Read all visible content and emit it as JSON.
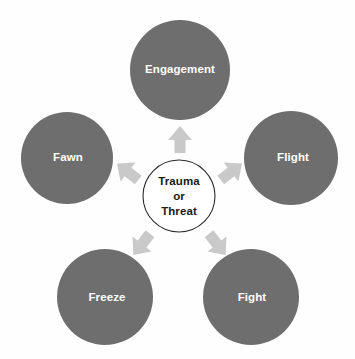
{
  "diagram": {
    "background_color": "#fefefe",
    "center": {
      "name": "trauma-or-threat",
      "lines": [
        "Trauma",
        "or",
        "Threat"
      ],
      "fill_color": "#ffffff",
      "stroke_color": "#2b2b2b",
      "text_color": "#1a1a1a",
      "cx": 179,
      "cy": 196,
      "r": 36
    },
    "node_fill_color": "#6e6e6e",
    "node_text_color": "#ffffff",
    "arrow_color": "#c9c9c9",
    "nodes": [
      {
        "name": "engagement",
        "label": "Engagement",
        "cx": 180,
        "cy": 70,
        "r": 50,
        "label_x": 180,
        "label_y": 70
      },
      {
        "name": "flight",
        "label": "Flight",
        "cx": 291,
        "cy": 158,
        "r": 47,
        "label_x": 293,
        "label_y": 158
      },
      {
        "name": "fawn",
        "label": "Fawn",
        "cx": 67,
        "cy": 158,
        "r": 46,
        "label_x": 68,
        "label_y": 158
      },
      {
        "name": "freeze",
        "label": "Freeze",
        "cx": 105,
        "cy": 297,
        "r": 48,
        "label_x": 107,
        "label_y": 298
      },
      {
        "name": "fight",
        "label": "Fight",
        "cx": 251,
        "cy": 297,
        "r": 48,
        "label_x": 252,
        "label_y": 298
      }
    ],
    "arrows": [
      {
        "name": "arrow-to-engagement",
        "target": "engagement",
        "angle": -90,
        "x": 180,
        "y": 140
      },
      {
        "name": "arrow-to-flight",
        "target": "flight",
        "angle": -38,
        "x": 230,
        "y": 172
      },
      {
        "name": "arrow-to-fawn",
        "target": "fawn",
        "angle": -142,
        "x": 128,
        "y": 172
      },
      {
        "name": "arrow-to-freeze",
        "target": "freeze",
        "angle": 128,
        "x": 142,
        "y": 243
      },
      {
        "name": "arrow-to-fight",
        "target": "fight",
        "angle": 52,
        "x": 216,
        "y": 243
      }
    ]
  }
}
